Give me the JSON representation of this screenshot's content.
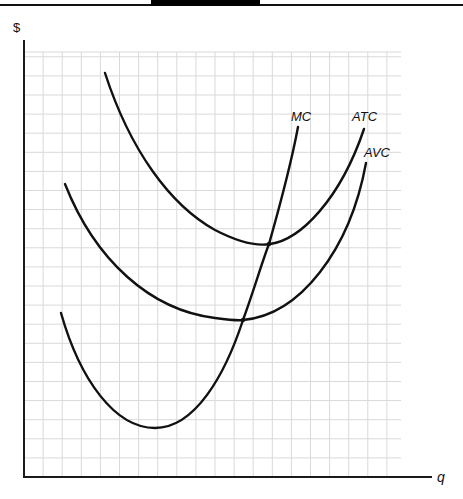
{
  "header": {
    "tab_color": "#000000",
    "rule_color": "#111111"
  },
  "chart_data": {
    "type": "line",
    "title": "",
    "xlabel": "q",
    "ylabel": "$",
    "grid": true,
    "legend": "none (curves labeled directly)",
    "x_ticks": [],
    "y_ticks": [],
    "axis_units": "grid squares (x: 0-20, y: 0-22), no numeric tick labels",
    "series": [
      {
        "name": "MC",
        "label": "MC",
        "shape": "U-shaped, minimum at low q, rises steeply; passes through minima of AVC and ATC",
        "points": [
          [
            2.0,
            8.4
          ],
          [
            3.5,
            4.2
          ],
          [
            4.9,
            2.6
          ],
          [
            6.5,
            3.5
          ],
          [
            8.0,
            6.2
          ],
          [
            9.4,
            8.4
          ],
          [
            10.8,
            12.4
          ],
          [
            12.2,
            18.5
          ]
        ]
      },
      {
        "name": "ATC",
        "label": "ATC",
        "shape": "U-shaped, highest of the average curves; minimum where MC crosses",
        "points": [
          [
            4.2,
            21.1
          ],
          [
            6.0,
            16.4
          ],
          [
            8.0,
            13.0
          ],
          [
            10.0,
            12.0
          ],
          [
            12.9,
            12.4
          ],
          [
            14.5,
            14.3
          ],
          [
            17.8,
            18.4
          ]
        ]
      },
      {
        "name": "AVC",
        "label": "AVC",
        "shape": "U-shaped, below ATC; minimum where MC crosses at lower q than ATC minimum",
        "points": [
          [
            2.2,
            15.3
          ],
          [
            4.0,
            12.2
          ],
          [
            6.0,
            9.9
          ],
          [
            8.0,
            8.7
          ],
          [
            11.5,
            8.4
          ],
          [
            14.0,
            10.0
          ],
          [
            16.5,
            13.5
          ],
          [
            17.9,
            16.6
          ]
        ]
      }
    ],
    "annotations": [
      {
        "text": "MC",
        "at": "top end of MC curve"
      },
      {
        "text": "ATC",
        "at": "top end of ATC curve"
      },
      {
        "text": "AVC",
        "at": "top end of AVC curve"
      }
    ],
    "intersections": [
      {
        "curves": [
          "MC",
          "ATC"
        ],
        "note": "at minimum of ATC"
      },
      {
        "curves": [
          "MC",
          "AVC"
        ],
        "note": "at minimum of AVC"
      }
    ]
  },
  "labels": {
    "y_axis": "$",
    "x_axis": "q",
    "mc": "MC",
    "atc": "ATC",
    "avc": "AVC"
  }
}
